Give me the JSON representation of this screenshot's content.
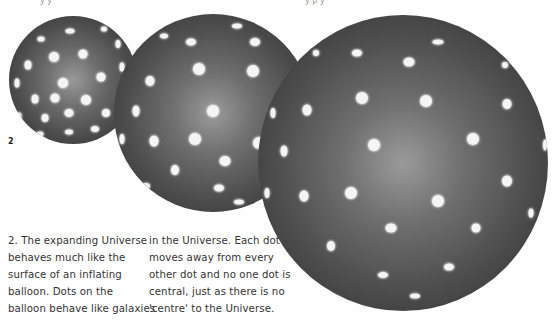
{
  "figure": {
    "label": "2",
    "top_clipped_text": [
      "y   y",
      "y     p  y"
    ]
  },
  "caption": {
    "left_lines": [
      "2. The expanding Universe",
      "behaves much like the",
      "surface of an inflating",
      "balloon. Dots on the",
      "balloon behave like galaxies"
    ],
    "right_lines": [
      "in the Universe. Each dot",
      "moves away from every",
      "other dot and no one dot is",
      "central, just as there is no",
      "'centre' to the Universe."
    ]
  },
  "spheres": [
    {
      "name": "small-balloon",
      "size": "small",
      "dot_count": 22
    },
    {
      "name": "medium-balloon",
      "size": "medium",
      "dot_count": 24
    },
    {
      "name": "large-balloon",
      "size": "large",
      "dot_count": 30
    }
  ],
  "colors": {
    "sphere_center": "#9a9a9a",
    "sphere_edge": "#2e2e2e",
    "dot": "#f4f4f4",
    "text": "#333333",
    "background": "#ffffff"
  }
}
